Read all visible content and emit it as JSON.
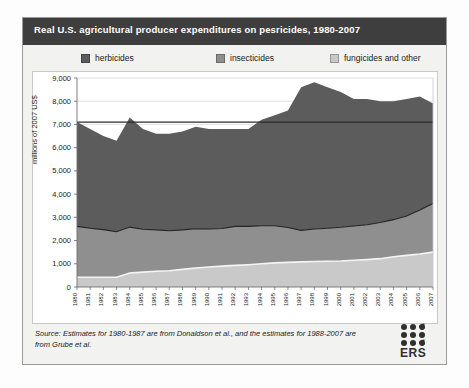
{
  "figure": {
    "title": "Real U.S. agricultural producer expenditures on pesricides, 1980-2007",
    "caption": "",
    "source_note": "Source: Estimates for 1980-1987 are from Donaldson et al., and the estimates for 1988-2007 are from Grube et al.",
    "logo": {
      "text": "ERS",
      "dot_color": "#2f2f2f"
    }
  },
  "legend": {
    "position": "top",
    "items": [
      {
        "label": "herbicides",
        "color": "#5c5c5c"
      },
      {
        "label": "insecticides",
        "color": "#8f8f8f"
      },
      {
        "label": "fungicides and other",
        "color": "#c9c9c9"
      }
    ]
  },
  "chart_data": {
    "type": "area",
    "title": "Real U.S. agricultural producer expenditures on pesricides, 1980-2007",
    "xlabel": "",
    "ylabel": "millions of 2007 US$",
    "ylim": [
      0,
      9000
    ],
    "ytick_labels": [
      "0",
      "1,000",
      "2,000",
      "3,000",
      "4,000",
      "5,000",
      "6,000",
      "7,000",
      "8,000",
      "9,000"
    ],
    "yticks": [
      0,
      1000,
      2000,
      3000,
      4000,
      5000,
      6000,
      7000,
      8000,
      9000
    ],
    "grid": true,
    "stacked": true,
    "x": [
      1980,
      1981,
      1982,
      1983,
      1984,
      1985,
      1986,
      1987,
      1988,
      1989,
      1990,
      1991,
      1992,
      1993,
      1994,
      1995,
      1996,
      1997,
      1998,
      1999,
      2000,
      2001,
      2002,
      2003,
      2004,
      2005,
      2006,
      2007
    ],
    "categories": [
      "1980",
      "1981",
      "1982",
      "1983",
      "1984",
      "1985",
      "1986",
      "1987",
      "1988",
      "1989",
      "1990",
      "1991",
      "1992",
      "1993",
      "1994",
      "1995",
      "1996",
      "1997",
      "1998",
      "1999",
      "2000",
      "2001",
      "2002",
      "2003",
      "2004",
      "2005",
      "2006",
      "2007"
    ],
    "series": [
      {
        "name": "fungicides and other",
        "color": "#c9c9c9",
        "values": [
          420,
          420,
          420,
          420,
          600,
          640,
          680,
          700,
          760,
          820,
          860,
          900,
          930,
          960,
          1000,
          1040,
          1060,
          1080,
          1100,
          1110,
          1120,
          1150,
          1180,
          1220,
          1300,
          1360,
          1420,
          1500
        ]
      },
      {
        "name": "insecticides",
        "color": "#8f8f8f",
        "values": [
          2190,
          2110,
          2050,
          1960,
          1980,
          1850,
          1780,
          1720,
          1700,
          1690,
          1640,
          1620,
          1680,
          1650,
          1640,
          1600,
          1500,
          1360,
          1400,
          1420,
          1450,
          1480,
          1500,
          1560,
          1600,
          1700,
          1900,
          2100
        ]
      },
      {
        "name": "herbicides",
        "color": "#5c5c5c",
        "values": [
          4490,
          4270,
          4030,
          3920,
          4720,
          4310,
          4140,
          4180,
          4240,
          4390,
          4300,
          4280,
          4190,
          4190,
          4560,
          4760,
          5040,
          6160,
          6320,
          6070,
          5830,
          5470,
          5420,
          5220,
          5100,
          5040,
          4880,
          4300
        ]
      }
    ],
    "totals": [
      7100,
      6800,
      6500,
      6300,
      7300,
      6800,
      6600,
      6600,
      6700,
      6900,
      6800,
      6800,
      6800,
      6800,
      7200,
      7400,
      7600,
      8600,
      8820,
      8600,
      8400,
      8100,
      8100,
      8000,
      8000,
      8100,
      8200,
      7900
    ],
    "reference_line": {
      "value": 7100,
      "color": "#2b2b2b"
    }
  }
}
